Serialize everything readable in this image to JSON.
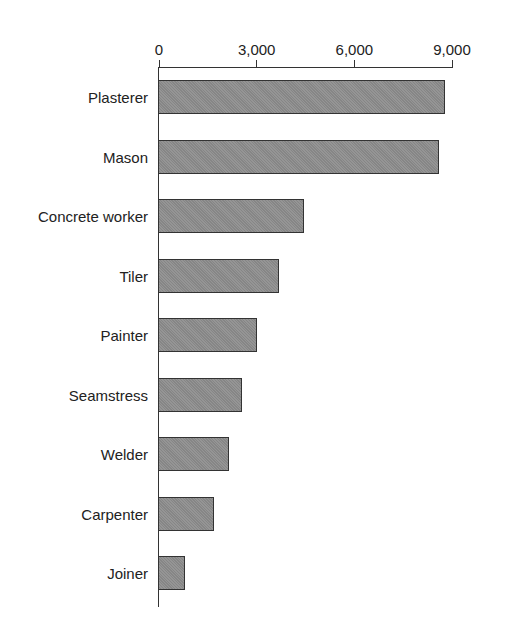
{
  "chart_data": {
    "type": "bar",
    "orientation": "horizontal",
    "title": "",
    "xlabel": "",
    "ylabel": "",
    "categories": [
      "Plasterer",
      "Mason",
      "Concrete worker",
      "Tiler",
      "Painter",
      "Seamstress",
      "Welder",
      "Carpenter",
      "Joiner"
    ],
    "values": [
      8800,
      8600,
      4450,
      3700,
      3000,
      2550,
      2150,
      1700,
      800
    ],
    "x_ticks": [
      "0",
      "3,000",
      "6,000",
      "9,000"
    ],
    "x_tick_values": [
      0,
      3000,
      6000,
      9000
    ],
    "xlim": [
      0,
      9000
    ],
    "axis_position": "top",
    "grid": false,
    "legend": null,
    "colors": {
      "bar_fill": "#8d8d8d",
      "bar_border": "#333333",
      "axis": "#333333"
    }
  }
}
